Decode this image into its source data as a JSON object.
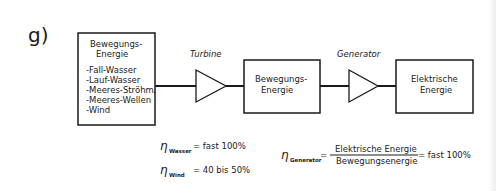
{
  "section_label": "g)",
  "blocks": [
    {
      "id": "source",
      "title_lines": [
        "Bewegungs-",
        "Energie"
      ],
      "items": [
        "-Fall-Wasser",
        "-Lauf-Wasser",
        "-Meeres-Ströhm.",
        "-Meeres-Wellen",
        "-Wind"
      ]
    },
    {
      "id": "mechanical",
      "title_lines": [
        "Bewegungs-",
        "Energie"
      ]
    },
    {
      "id": "electrical",
      "title_lines": [
        "Elektrische",
        "Energie"
      ]
    }
  ],
  "converters": [
    {
      "label": "Turbine"
    },
    {
      "label": "Generator"
    }
  ],
  "efficiencies": {
    "water": {
      "symbol": "η",
      "subscript": "Wasser",
      "value": "= fast  100%"
    },
    "wind": {
      "symbol": "η",
      "subscript": "Wind",
      "value": "= 40 bis 50%"
    },
    "generator": {
      "symbol": "η",
      "subscript": "Generator",
      "eq": "=",
      "numerator": "Elektrische  Energie",
      "denominator": "Bewegungsenergie",
      "value": "= fast  100%"
    }
  }
}
